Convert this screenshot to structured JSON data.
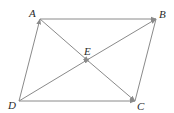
{
  "diagram": {
    "type": "parallelogram-vectors",
    "colors": {
      "line": "#8a8a8a",
      "label": "#2a2a2a",
      "background": "#ffffff"
    },
    "points": {
      "A": {
        "label": "A",
        "x": 40,
        "y": 19
      },
      "B": {
        "label": "B",
        "x": 156,
        "y": 19
      },
      "C": {
        "label": "C",
        "x": 135,
        "y": 101
      },
      "D": {
        "label": "D",
        "x": 19,
        "y": 101
      },
      "E": {
        "label": "E",
        "x": 87,
        "y": 60
      }
    },
    "labels": {
      "A": "A",
      "B": "B",
      "C": "C",
      "D": "D",
      "E": "E"
    },
    "edges": [
      {
        "from": "A",
        "to": "B",
        "arrow_end": true
      },
      {
        "from": "D",
        "to": "A",
        "arrow_end": true
      },
      {
        "from": "D",
        "to": "C",
        "arrow_end": true
      },
      {
        "from": "B",
        "to": "C",
        "arrow_end": false
      },
      {
        "from": "D",
        "to": "B",
        "arrow_end": true,
        "arrow_mid": true
      },
      {
        "from": "A",
        "to": "C",
        "arrow_end": true,
        "arrow_mid": true
      }
    ]
  }
}
